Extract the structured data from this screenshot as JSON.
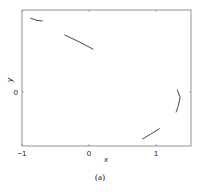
{
  "chart_data": {
    "type": "line",
    "title": "",
    "caption": "(a)",
    "xlabel": "x",
    "ylabel": "y",
    "xlim": [
      -1,
      1.5
    ],
    "ylim": [
      -1.0,
      1.25
    ],
    "xticks": [
      -1,
      0,
      1
    ],
    "xtick_labels": [
      "-1",
      "0",
      "1"
    ],
    "yticks": [
      0
    ],
    "ytick_labels": [
      "0"
    ],
    "grid": false,
    "legend": null,
    "series": [
      {
        "name": "curve-top-left",
        "x": [
          -0.87,
          -0.78,
          -0.7
        ],
        "y": [
          1.1,
          1.07,
          1.06
        ]
      },
      {
        "name": "curve-middle",
        "x": [
          -0.36,
          -0.15,
          0.06
        ],
        "y": [
          0.85,
          0.75,
          0.64
        ]
      },
      {
        "name": "curve-right-arc",
        "x": [
          1.32,
          1.36,
          1.33,
          1.3
        ],
        "y": [
          0.03,
          -0.08,
          -0.22,
          -0.3
        ]
      },
      {
        "name": "curve-bottom",
        "x": [
          0.8,
          0.92,
          1.05
        ],
        "y": [
          -0.7,
          -0.63,
          -0.55
        ]
      }
    ]
  }
}
